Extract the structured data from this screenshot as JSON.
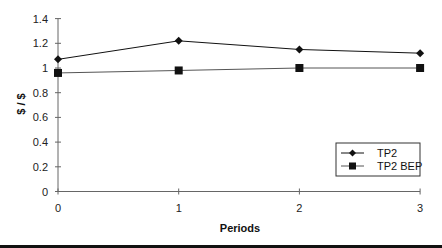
{
  "chart_data": {
    "type": "line",
    "title": "",
    "xlabel": "Periods",
    "ylabel": "$ / $",
    "x": [
      0,
      1,
      2,
      3
    ],
    "categories": [
      "0",
      "1",
      "2",
      "3"
    ],
    "ylim": [
      0,
      1.4
    ],
    "yticks": [
      "0",
      "0.2",
      "0.4",
      "0.6",
      "0.8",
      "1",
      "1.2",
      "1.4"
    ],
    "ytick_values": [
      0,
      0.2,
      0.4,
      0.6,
      0.8,
      1.0,
      1.2,
      1.4
    ],
    "grid": false,
    "legend_position": "lower right",
    "series": [
      {
        "name": "TP2",
        "marker": "diamond",
        "color": "#111111",
        "values": [
          1.07,
          1.22,
          1.15,
          1.12
        ]
      },
      {
        "name": "TP2 BEP",
        "marker": "square",
        "color": "#111111",
        "values": [
          0.96,
          0.98,
          1.0,
          1.0
        ]
      }
    ]
  },
  "legend": {
    "items": [
      {
        "label": "TP2"
      },
      {
        "label": "TP2 BEP"
      }
    ]
  }
}
